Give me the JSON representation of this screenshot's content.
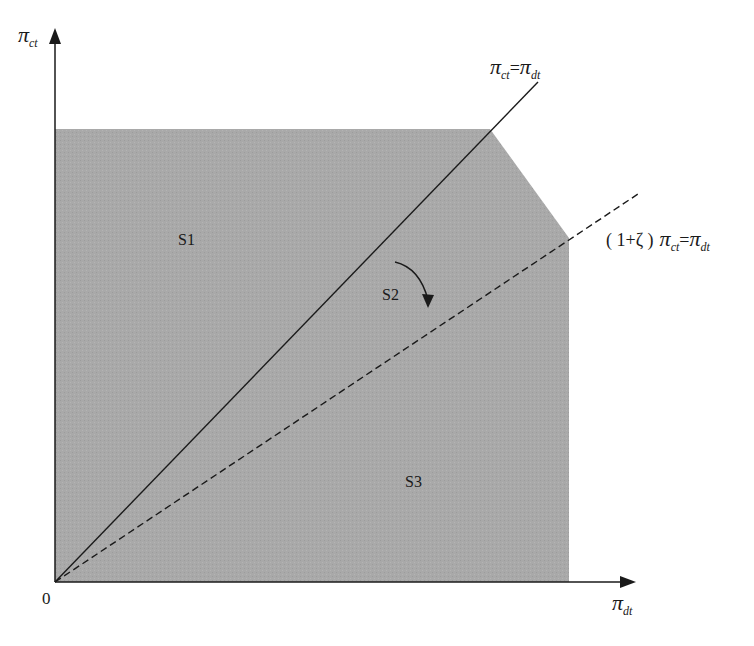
{
  "diagram": {
    "colors": {
      "region_fill": "#a9a9a9",
      "axis": "#1a1a1a",
      "line": "#1a1a1a"
    },
    "axes": {
      "y_label": {
        "symbol": "π",
        "subscript": "ct"
      },
      "x_label": {
        "symbol": "π",
        "subscript": "dt"
      },
      "origin_label": "0"
    },
    "regions": [
      {
        "id": "S1",
        "label": "S1"
      },
      {
        "id": "S2",
        "label": "S2"
      },
      {
        "id": "S3",
        "label": "S3"
      }
    ],
    "lines": {
      "solid": {
        "style": "solid",
        "label_parts": {
          "lhs_symbol": "π",
          "lhs_sub": "ct",
          "eq": "=",
          "rhs_symbol": "π",
          "rhs_sub": "dt"
        }
      },
      "dashed": {
        "style": "dashed",
        "label_parts": {
          "prefix": "( 1+ζ )",
          "lhs_symbol": "π",
          "lhs_sub": "ct",
          "eq": "=",
          "rhs_symbol": "π",
          "rhs_sub": "dt"
        }
      }
    },
    "annotation": {
      "type": "curved-arrow",
      "meaning": "rotation from solid line toward dashed line"
    }
  }
}
